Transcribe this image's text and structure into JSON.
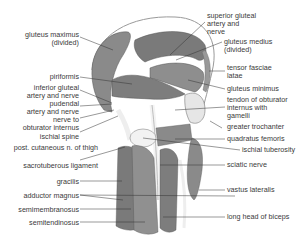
{
  "diagram": {
    "left_labels": [
      {
        "id": "gluteus-maximus",
        "text": "gluteus maximus\n(divided)"
      },
      {
        "id": "piriformis",
        "text": "piriformis"
      },
      {
        "id": "inferior-gluteal",
        "text": "inferior gluteal\nartery and nerve"
      },
      {
        "id": "pudendal",
        "text": "pudendal\nartery and nerve"
      },
      {
        "id": "nerve-obturator",
        "text": "nerve to\nobturator internus"
      },
      {
        "id": "ischial-spine",
        "text": "ischial spine"
      },
      {
        "id": "post-cutaneous",
        "text": "post. cutaneous n. of thigh"
      },
      {
        "id": "sacrotuberous",
        "text": "sacrotuberous ligament"
      },
      {
        "id": "gracilis",
        "text": "gracilis"
      },
      {
        "id": "adductor-magnus",
        "text": "adductor magnus"
      },
      {
        "id": "semimembranosus",
        "text": "semimembranosus"
      },
      {
        "id": "semitendinosus",
        "text": "semitendinosus"
      }
    ],
    "right_labels": [
      {
        "id": "superior-gluteal",
        "text": "superior gluteal\nartery and\nnerve"
      },
      {
        "id": "gluteus-medius",
        "text": "gluteus medius\n(divided)"
      },
      {
        "id": "tensor-fasciae",
        "text": "tensor fasciae\nlatae"
      },
      {
        "id": "gluteus-minimus",
        "text": "gluteus minimus"
      },
      {
        "id": "tendon-obturator",
        "text": "tendon of obturator\ninternus with\ngamelli"
      },
      {
        "id": "greater-trochanter",
        "text": "greater trochanter"
      },
      {
        "id": "quadratus-femoris",
        "text": "quadratus femoris"
      },
      {
        "id": "ischial-tuberosity",
        "text": "ischial tuberosity"
      },
      {
        "id": "sciatic-nerve",
        "text": "sciatic nerve"
      },
      {
        "id": "vastus-lateralis",
        "text": "vastus lateralis"
      },
      {
        "id": "long-head-biceps",
        "text": "long head of biceps"
      }
    ]
  }
}
